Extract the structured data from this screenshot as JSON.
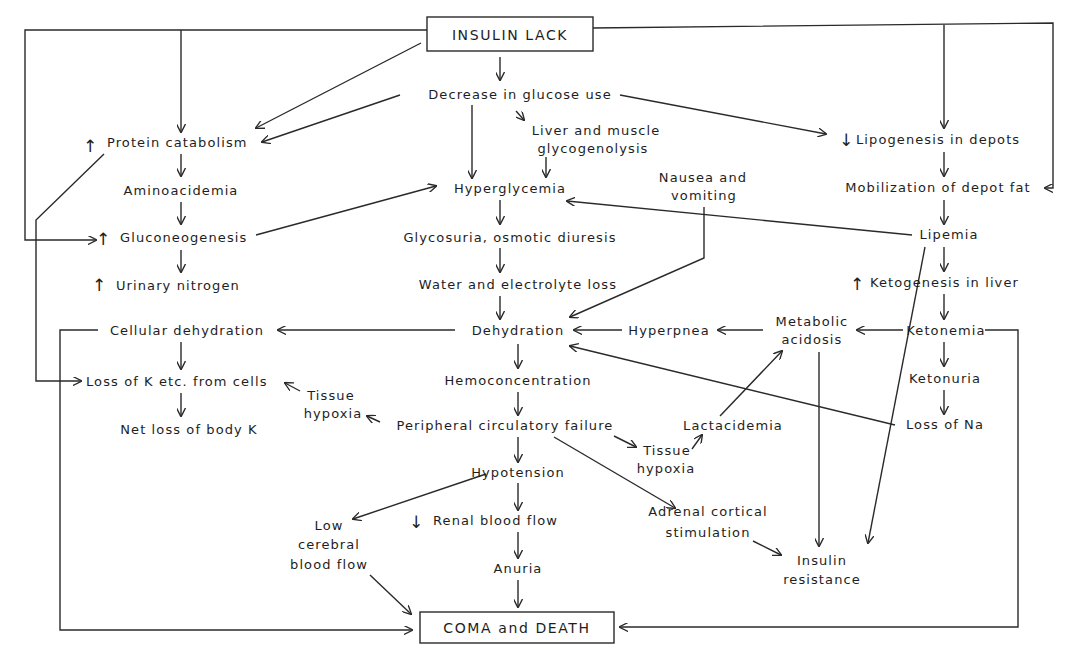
{
  "colors": {
    "ink": "#1e1e1e",
    "background": "#ffffff"
  },
  "nodes": {
    "insulin_lack": "INSULIN LACK",
    "decrease_glucose_use": "Decrease in glucose use",
    "liver_muscle_1": "Liver and muscle",
    "liver_muscle_2": "glycogenolysis",
    "protein_catabolism": "Protein catabolism",
    "aminoacidemia": "Aminoacidemia",
    "gluconeogenesis": "Gluconeogenesis",
    "urinary_nitrogen": "Urinary nitrogen",
    "hyperglycemia": "Hyperglycemia",
    "glycosuria": "Glycosuria, osmotic diuresis",
    "water_electrolyte_loss": "Water and electrolyte loss",
    "nausea_1": "Nausea and",
    "nausea_2": "vomiting",
    "lipogenesis": "Lipogenesis in depots",
    "mobilization": "Mobilization of depot fat",
    "lipemia": "Lipemia",
    "ketogenesis": "Ketogenesis in liver",
    "ketonemia": "Ketonemia",
    "ketonuria": "Ketonuria",
    "loss_na": "Loss of Na",
    "metabolic_1": "Metabolic",
    "metabolic_2": "acidosis",
    "hyperpnea": "Hyperpnea",
    "dehydration": "Dehydration",
    "cellular_dehydration": "Cellular dehydration",
    "loss_k_cells": "Loss of K etc. from cells",
    "net_loss_k": "Net loss of body K",
    "tissue_hypoxia_left_1": "Tissue",
    "tissue_hypoxia_left_2": "hypoxia",
    "hemoconcentration": "Hemoconcentration",
    "peripheral_failure": "Peripheral circulatory failure",
    "tissue_hypoxia_right_1": "Tissue",
    "tissue_hypoxia_right_2": "hypoxia",
    "lactacidemia": "Lactacidemia",
    "hypotension": "Hypotension",
    "low_cerebral_1": "Low",
    "low_cerebral_2": "cerebral",
    "low_cerebral_3": "blood flow",
    "renal_blood_flow": "Renal blood flow",
    "anuria": "Anuria",
    "adrenal_1": "Adrenal cortical",
    "adrenal_2": "stimulation",
    "insulin_resistance_1": "Insulin",
    "insulin_resistance_2": "resistance",
    "coma_death": "COMA and DEATH"
  },
  "modifiers": {
    "increase": "↑",
    "decrease": "↓"
  },
  "edges": [
    [
      "INSULIN LACK",
      "Decrease in glucose use"
    ],
    [
      "INSULIN LACK",
      "Protein catabolism"
    ],
    [
      "INSULIN LACK",
      "Gluconeogenesis"
    ],
    [
      "INSULIN LACK",
      "Lipogenesis in depots"
    ],
    [
      "INSULIN LACK",
      "Mobilization of depot fat"
    ],
    [
      "Decrease in glucose use",
      "Protein catabolism"
    ],
    [
      "Decrease in glucose use",
      "Liver and muscle glycogenolysis"
    ],
    [
      "Decrease in glucose use",
      "Hyperglycemia"
    ],
    [
      "Decrease in glucose use",
      "Lipogenesis in depots"
    ],
    [
      "Liver and muscle glycogenolysis",
      "Hyperglycemia"
    ],
    [
      "Protein catabolism",
      "Aminoacidemia"
    ],
    [
      "Protein catabolism",
      "Loss of K etc. from cells"
    ],
    [
      "Aminoacidemia",
      "Gluconeogenesis"
    ],
    [
      "Gluconeogenesis",
      "Urinary nitrogen"
    ],
    [
      "Gluconeogenesis",
      "Hyperglycemia"
    ],
    [
      "Hyperglycemia",
      "Glycosuria, osmotic diuresis"
    ],
    [
      "Glycosuria, osmotic diuresis",
      "Water and electrolyte loss"
    ],
    [
      "Water and electrolyte loss",
      "Dehydration"
    ],
    [
      "Nausea and vomiting",
      "Dehydration"
    ],
    [
      "Lipogenesis in depots",
      "Mobilization of depot fat"
    ],
    [
      "Mobilization of depot fat",
      "Lipemia"
    ],
    [
      "Lipemia",
      "Hyperglycemia"
    ],
    [
      "Lipemia",
      "Ketogenesis in liver"
    ],
    [
      "Lipemia",
      "Insulin resistance"
    ],
    [
      "Ketogenesis in liver",
      "Ketonemia"
    ],
    [
      "Ketonemia",
      "Metabolic acidosis"
    ],
    [
      "Ketonemia",
      "Ketonuria"
    ],
    [
      "Ketonemia",
      "COMA and DEATH"
    ],
    [
      "Ketonuria",
      "Loss of Na"
    ],
    [
      "Loss of Na",
      "Dehydration"
    ],
    [
      "Metabolic acidosis",
      "Hyperpnea"
    ],
    [
      "Metabolic acidosis",
      "Insulin resistance"
    ],
    [
      "Hyperpnea",
      "Dehydration"
    ],
    [
      "Dehydration",
      "Cellular dehydration"
    ],
    [
      "Dehydration",
      "Hemoconcentration"
    ],
    [
      "Cellular dehydration",
      "Loss of K etc. from cells"
    ],
    [
      "Cellular dehydration",
      "COMA and DEATH"
    ],
    [
      "Loss of K etc. from cells",
      "Net loss of body K"
    ],
    [
      "Tissue hypoxia",
      "Loss of K etc. from cells"
    ],
    [
      "Hemoconcentration",
      "Peripheral circulatory failure"
    ],
    [
      "Peripheral circulatory failure",
      "Tissue hypoxia (left)"
    ],
    [
      "Peripheral circulatory failure",
      "Tissue hypoxia (right)"
    ],
    [
      "Peripheral circulatory failure",
      "Hypotension"
    ],
    [
      "Peripheral circulatory failure",
      "Adrenal cortical stimulation"
    ],
    [
      "Tissue hypoxia (right)",
      "Lactacidemia"
    ],
    [
      "Lactacidemia",
      "Metabolic acidosis"
    ],
    [
      "Hypotension",
      "Low cerebral blood flow"
    ],
    [
      "Hypotension",
      "Renal blood flow"
    ],
    [
      "Renal blood flow",
      "Anuria"
    ],
    [
      "Anuria",
      "COMA and DEATH"
    ],
    [
      "Low cerebral blood flow",
      "COMA and DEATH"
    ],
    [
      "Adrenal cortical stimulation",
      "Insulin resistance"
    ]
  ]
}
